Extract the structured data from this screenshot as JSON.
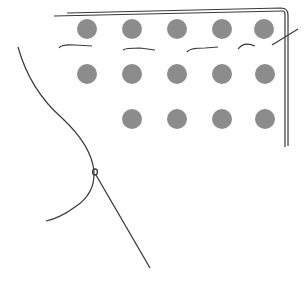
{
  "figure": {
    "type": "line-drawing",
    "colors": {
      "background": "#ffffff",
      "stroke": "#3a3a3a",
      "dot": "#8c8c8c"
    },
    "dot_radius": 10,
    "dots": [
      {
        "row": 1,
        "x": 87,
        "y": 29
      },
      {
        "row": 1,
        "x": 132,
        "y": 29
      },
      {
        "row": 1,
        "x": 177,
        "y": 29
      },
      {
        "row": 1,
        "x": 222,
        "y": 29
      },
      {
        "row": 1,
        "x": 264,
        "y": 29
      },
      {
        "row": 2,
        "x": 87,
        "y": 74
      },
      {
        "row": 2,
        "x": 132,
        "y": 74
      },
      {
        "row": 2,
        "x": 177,
        "y": 74
      },
      {
        "row": 2,
        "x": 222,
        "y": 74
      },
      {
        "row": 2,
        "x": 265,
        "y": 74
      },
      {
        "row": 3,
        "x": 132,
        "y": 119
      },
      {
        "row": 3,
        "x": 177,
        "y": 119
      },
      {
        "row": 3,
        "x": 222,
        "y": 119
      },
      {
        "row": 3,
        "x": 265,
        "y": 119
      }
    ]
  }
}
